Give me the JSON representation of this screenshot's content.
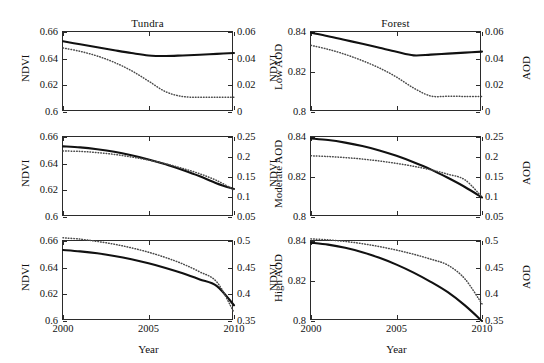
{
  "figure": {
    "columns": [
      "Tundra",
      "Forest"
    ],
    "xlabel": "Year",
    "x_ticks": [
      "2000",
      "2005",
      "2010"
    ]
  },
  "chart_data": {
    "type": "line",
    "title": "",
    "xlabel": "Year",
    "x": [
      2000,
      2001,
      2002,
      2003,
      2004,
      2005,
      2006,
      2007,
      2008,
      2009,
      2010
    ],
    "xlim": [
      2000,
      2010
    ],
    "grid": false,
    "legend": "none",
    "series_styles": {
      "ndvi": "solid",
      "aod": "dotted"
    },
    "panels": [
      {
        "row": 0,
        "col": 0,
        "column_label": "Tundra",
        "left_axis_label": "NDVI",
        "right_axis_label": "Low AOD",
        "left_ticks": [
          "0.6",
          "0.62",
          "0.64",
          "0.66"
        ],
        "right_ticks": [
          "0",
          "0.02",
          "0.04",
          "0.06"
        ],
        "ylim_left": [
          0.6,
          0.66
        ],
        "ylim_right": [
          0,
          0.06
        ],
        "series": [
          {
            "name": "NDVI",
            "axis": "left",
            "style": "solid",
            "values": [
              0.653,
              0.6508,
              0.6485,
              0.6463,
              0.6442,
              0.6424,
              0.642,
              0.6424,
              0.6429,
              0.6436,
              0.6442
            ]
          },
          {
            "name": "AOD",
            "axis": "right",
            "style": "dotted",
            "values": [
              0.048,
              0.0455,
              0.042,
              0.0372,
              0.031,
              0.0232,
              0.0152,
              0.0116,
              0.0111,
              0.011,
              0.011
            ]
          }
        ]
      },
      {
        "row": 0,
        "col": 1,
        "column_label": "Forest",
        "left_axis_label": "NDVI",
        "right_axis_label": "AOD",
        "left_ticks": [
          "0.8",
          "0.82",
          "0.84"
        ],
        "right_ticks": [
          "0",
          "0.02",
          "0.04",
          "0.06"
        ],
        "ylim_left": [
          0.8,
          0.84
        ],
        "ylim_right": [
          0,
          0.06
        ],
        "series": [
          {
            "name": "NDVI",
            "axis": "left",
            "style": "solid",
            "values": [
              0.8396,
              0.8379,
              0.836,
              0.8341,
              0.8321,
              0.8301,
              0.8283,
              0.8287,
              0.8292,
              0.8297,
              0.8302
            ]
          },
          {
            "name": "AOD",
            "axis": "right",
            "style": "dotted",
            "values": [
              0.05,
              0.047,
              0.0432,
              0.0385,
              0.033,
              0.0262,
              0.018,
              0.012,
              0.0118,
              0.0117,
              0.0117
            ]
          }
        ]
      },
      {
        "row": 1,
        "col": 0,
        "column_label": "Tundra",
        "left_axis_label": "NDVI",
        "right_axis_label": "Moderate AOD",
        "left_ticks": [
          "0.6",
          "0.62",
          "0.64",
          "0.66"
        ],
        "right_ticks": [
          "0.05",
          "0.1",
          "0.15",
          "0.2",
          "0.25"
        ],
        "ylim_left": [
          0.6,
          0.66
        ],
        "ylim_right": [
          0.05,
          0.25
        ],
        "series": [
          {
            "name": "NDVI",
            "axis": "left",
            "style": "solid",
            "values": [
              0.653,
              0.6522,
              0.6508,
              0.6489,
              0.6463,
              0.6432,
              0.6395,
              0.6352,
              0.6305,
              0.6252,
              0.621
            ]
          },
          {
            "name": "AOD",
            "axis": "right",
            "style": "dotted",
            "values": [
              0.215,
              0.214,
              0.211,
              0.2065,
              0.2,
              0.1925,
              0.183,
              0.1715,
              0.158,
              0.141,
              0.118
            ]
          }
        ]
      },
      {
        "row": 1,
        "col": 1,
        "column_label": "Forest",
        "left_axis_label": "NDVI",
        "right_axis_label": "AOD",
        "left_ticks": [
          "0.8",
          "0.82",
          "0.84"
        ],
        "right_ticks": [
          "0.05",
          "0.1",
          "0.15",
          "0.2",
          "0.25"
        ],
        "ylim_left": [
          0.8,
          0.84
        ],
        "ylim_right": [
          0.05,
          0.25
        ],
        "series": [
          {
            "name": "NDVI",
            "axis": "left",
            "style": "solid",
            "values": [
              0.8393,
              0.8385,
              0.8372,
              0.8355,
              0.8333,
              0.8306,
              0.8274,
              0.8238,
              0.8196,
              0.815,
              0.8098
            ]
          },
          {
            "name": "AOD",
            "axis": "right",
            "style": "dotted",
            "values": [
              0.203,
              0.2012,
              0.1985,
              0.1948,
              0.19,
              0.184,
              0.1768,
              0.168,
              0.157,
              0.143,
              0.1
            ]
          }
        ]
      },
      {
        "row": 2,
        "col": 0,
        "column_label": "Tundra",
        "left_axis_label": "NDVI",
        "right_axis_label": "High AOD",
        "left_ticks": [
          "0.6",
          "0.62",
          "0.64",
          "0.66"
        ],
        "right_ticks": [
          "0.35",
          "0.4",
          "0.45",
          "0.5"
        ],
        "ylim_left": [
          0.6,
          0.66
        ],
        "ylim_right": [
          0.35,
          0.5
        ],
        "series": [
          {
            "name": "NDVI",
            "axis": "left",
            "style": "solid",
            "values": [
              0.6532,
              0.6522,
              0.6508,
              0.6488,
              0.6463,
              0.6433,
              0.6398,
              0.6358,
              0.6312,
              0.6262,
              0.6118
            ]
          },
          {
            "name": "AOD",
            "axis": "right",
            "style": "dotted",
            "values": [
              0.506,
              0.5035,
              0.4992,
              0.494,
              0.4872,
              0.479,
              0.469,
              0.457,
              0.442,
              0.423,
              0.366
            ]
          }
        ]
      },
      {
        "row": 2,
        "col": 1,
        "column_label": "Forest",
        "left_axis_label": "NDVI",
        "right_axis_label": "AOD",
        "left_ticks": [
          "0.8",
          "0.82",
          "0.84"
        ],
        "right_ticks": [
          "0.35",
          "0.4",
          "0.45",
          "0.5"
        ],
        "ylim_left": [
          0.8,
          0.84
        ],
        "ylim_right": [
          0.35,
          0.5
        ],
        "series": [
          {
            "name": "NDVI",
            "axis": "left",
            "style": "solid",
            "values": [
              0.8392,
              0.8382,
              0.8366,
              0.8344,
              0.8316,
              0.8282,
              0.8242,
              0.8196,
              0.8144,
              0.8078,
              0.8
            ]
          },
          {
            "name": "AOD",
            "axis": "right",
            "style": "dotted",
            "values": [
              0.504,
              0.5022,
              0.4992,
              0.495,
              0.4895,
              0.483,
              0.4752,
              0.466,
              0.4548,
              0.429,
              0.382
            ]
          }
        ]
      }
    ]
  }
}
